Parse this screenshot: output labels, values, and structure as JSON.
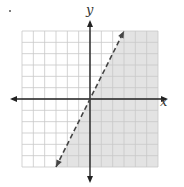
{
  "chart_data": {
    "type": "inequality-graph",
    "title": "",
    "xlabel": "x",
    "ylabel": "y",
    "xlim": [
      -6,
      6
    ],
    "ylim": [
      -6,
      6
    ],
    "grid": true,
    "grid_step": 1,
    "boundary_line": {
      "style": "dashed",
      "slope": 2,
      "intercept": 0,
      "equation": "y = 2x",
      "points": [
        [
          -3,
          -6
        ],
        [
          0,
          0
        ],
        [
          3,
          6
        ]
      ]
    },
    "shaded_region": "right of / below the line",
    "inequality": "y < 2x",
    "colors": {
      "shade": "#e3e3e3",
      "grid": "#c8c8c8",
      "axis": "#222222",
      "line": "#444444"
    }
  },
  "labels": {
    "x_axis": "x",
    "y_axis": "y"
  }
}
